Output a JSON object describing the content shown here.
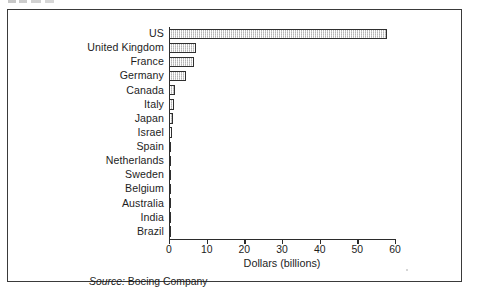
{
  "figure": {
    "source_prefix": "Source:",
    "source_text": " Boeing Company"
  },
  "chart_data": {
    "type": "bar",
    "orientation": "horizontal",
    "title": "",
    "subtitle": "",
    "xlabel": "Dollars (billions)",
    "ylabel": "",
    "xlim": [
      0,
      60
    ],
    "xticks": [
      0,
      10,
      20,
      30,
      40,
      50,
      60
    ],
    "xticklabels": [
      "0",
      "10",
      "20",
      "30",
      "40",
      "50",
      "60"
    ],
    "grid": false,
    "legend": null,
    "bar_fill_color": "#e9e9e9",
    "bar_edge_color": "#2f2f2f",
    "categories": [
      "US",
      "United Kingdom",
      "France",
      "Germany",
      "Canada",
      "Italy",
      "Japan",
      "Israel",
      "Spain",
      "Netherlands",
      "Sweden",
      "Belgium",
      "Australia",
      "India",
      "Brazil"
    ],
    "values": [
      58.0,
      7.3,
      6.7,
      4.4,
      1.7,
      1.4,
      1.1,
      0.7,
      0.6,
      0.5,
      0.4,
      0.35,
      0.3,
      0.25,
      0.2
    ],
    "source": "Source: Boeing Company"
  }
}
